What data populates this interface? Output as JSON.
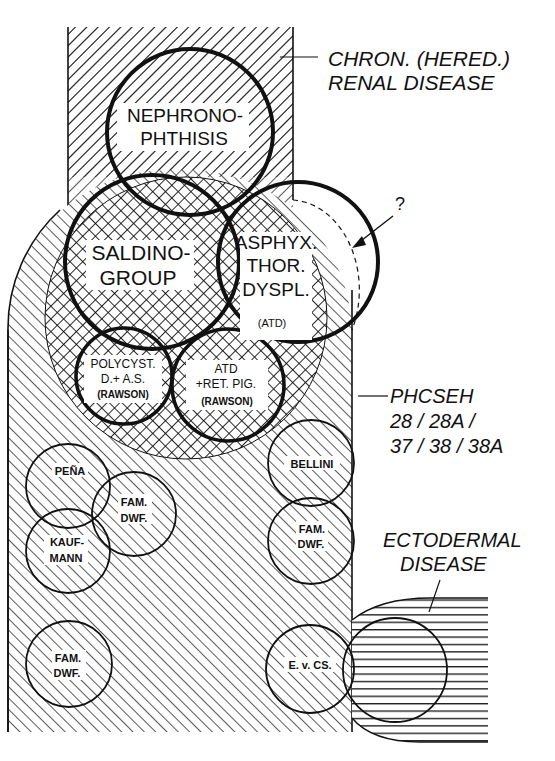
{
  "diagram": {
    "colors": {
      "ink": "#111111",
      "background": "#ffffff"
    },
    "regions": {
      "renal": {
        "label_line1": "CHRON. (HERED.)",
        "label_line2": "RENAL DISEASE"
      },
      "phcseh": {
        "label_line1": "PHCSEH",
        "label_line2": "28 / 28A /",
        "label_line3": "37 / 38 / 38A"
      },
      "ectodermal": {
        "label_line1": "ECTODERMAL",
        "label_line2": "DISEASE"
      }
    },
    "circles": {
      "nephronophthisis": {
        "line1": "NEPHRONO-",
        "line2": "PHTHISIS"
      },
      "saldino": {
        "line1": "SALDINO-",
        "line2": "GROUP"
      },
      "asphyx": {
        "line1": "ASPHYX.",
        "line2": "THOR.",
        "line3": "DYSPL.",
        "line4": "(ATD)"
      },
      "polycyst": {
        "line1": "POLYCYST.",
        "line2": "D.+ A.S.",
        "line3": "(RAWSON)"
      },
      "atd_ret": {
        "line1": "ATD",
        "line2": "+RET. PIG.",
        "line3": "(RAWSON)"
      },
      "pena": {
        "line1": "PEÑA"
      },
      "fam_dwf_1": {
        "line1": "FAM.",
        "line2": "DWF."
      },
      "kaufmann": {
        "line1": "KAUF-",
        "line2": "MANN"
      },
      "bellini": {
        "line1": "BELLINI"
      },
      "fam_dwf_2": {
        "line1": "FAM.",
        "line2": "DWF."
      },
      "fam_dwf_3": {
        "line1": "FAM.",
        "line2": "DWF."
      },
      "evcs": {
        "line1": "E. v. CS."
      }
    },
    "question_mark": "?"
  }
}
